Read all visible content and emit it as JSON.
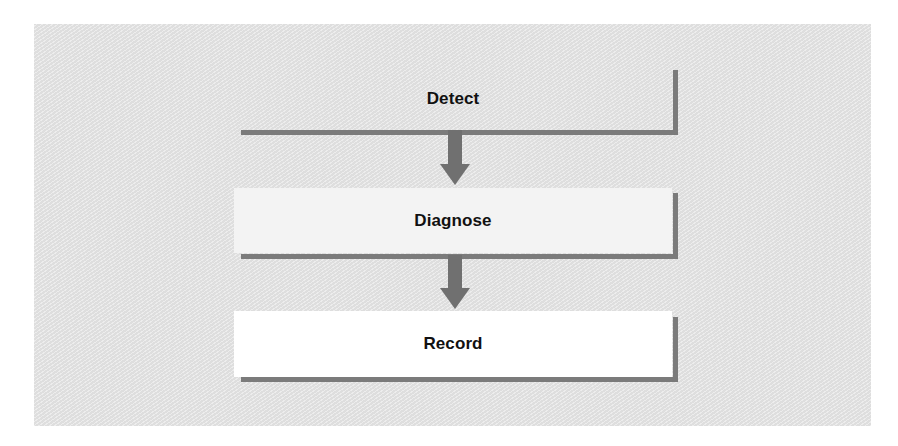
{
  "diagram": {
    "type": "vertical-flow",
    "steps": [
      {
        "label": "Detect",
        "fill": "transparent"
      },
      {
        "label": "Diagnose",
        "fill": "#f3f3f3"
      },
      {
        "label": "Record",
        "fill": "#ffffff"
      }
    ],
    "arrows": [
      {
        "from": "Detect",
        "to": "Diagnose"
      },
      {
        "from": "Diagnose",
        "to": "Record"
      }
    ],
    "colors": {
      "panel_background": "#e3e3e3",
      "border": "#7b7b7b",
      "arrow": "#707070",
      "text": "#111111"
    }
  }
}
